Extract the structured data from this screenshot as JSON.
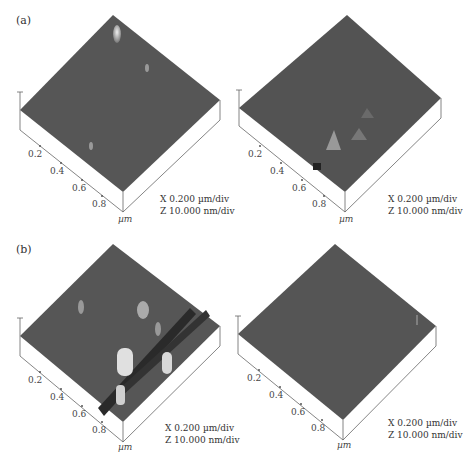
{
  "figure": {
    "panels": [
      {
        "label": "(a)",
        "row": "a"
      },
      {
        "label": "(b)",
        "row": "b"
      }
    ],
    "plots": [
      {
        "id": "a-left",
        "ticks": [
          "0.2",
          "0.4",
          "0.6",
          "0.8"
        ],
        "unit": "µm",
        "scale_x": "X  0.200 µm/div",
        "scale_z": "Z  10.000 nm/div"
      },
      {
        "id": "a-right",
        "ticks": [
          "0.2",
          "0.4",
          "0.6",
          "0.8"
        ],
        "unit": "µm",
        "scale_x": "X  0.200 µm/div",
        "scale_z": "Z  10.000 nm/div"
      },
      {
        "id": "b-left",
        "ticks": [
          "0.2",
          "0.4",
          "0.6",
          "0.8"
        ],
        "unit": "µm",
        "scale_x": "X  0.200 µm/div",
        "scale_z": "Z  10.000 nm/div"
      },
      {
        "id": "b-right",
        "ticks": [
          "0.2",
          "0.4",
          "0.6",
          "0.8"
        ],
        "unit": "µm",
        "scale_x": "X  0.200 µm/div",
        "scale_z": "Z  10.000 nm/div"
      }
    ]
  },
  "colors": {
    "surface": "#555555",
    "surface_dark": "#3e3e3e",
    "peak": "#d8d8d8",
    "axis": "#555555"
  }
}
